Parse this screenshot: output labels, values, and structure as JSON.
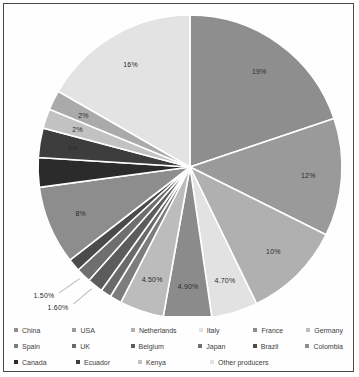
{
  "chart_data": {
    "type": "pie",
    "title": "",
    "start_angle_deg": 0,
    "direction": "clockwise",
    "legend_position": "bottom",
    "grid": false,
    "unit": "%",
    "categories": [
      "China",
      "USA",
      "Netherlands",
      "Italy",
      "France",
      "Germany",
      "Spain",
      "UK",
      "Belgium",
      "Japan",
      "Brazil",
      "Colombia",
      "Canada",
      "Ecuador",
      "Kenya",
      "Other producers"
    ],
    "values": [
      19,
      12,
      10,
      4.7,
      4.9,
      4.5,
      1.2,
      1.1,
      1.6,
      1.5,
      1.3,
      8,
      3,
      2,
      2,
      16
    ],
    "labels": [
      "19%",
      "12%",
      "10%",
      "4.70%",
      "4.90%",
      "4.50%",
      "",
      "",
      "1.60%",
      "1.50%",
      "",
      "8%",
      "3%",
      "2%",
      "2%",
      "16%"
    ],
    "colors": [
      "#8e8e8e",
      "#9a9a9a",
      "#b3b3b3",
      "#e4e4e4",
      "#a2a2a2",
      "#b8b8b8",
      "#8a8a8a",
      "#6e6e6e",
      "#5e5e5e",
      "#707070",
      "#4a4a4a",
      "#8c8c8c",
      "#2e2e2e",
      "#3f3f3f",
      "#c6c6c6",
      "#a8a8a8"
    ],
    "slices": [
      {
        "name": "China",
        "value": 19,
        "label": "19%",
        "color": "#8e8e8e"
      },
      {
        "name": "USA",
        "value": 12,
        "label": "12%",
        "color": "#9a9a9a"
      },
      {
        "name": "Netherlands",
        "value": 10,
        "label": "10%",
        "color": "#b0b0b0"
      },
      {
        "name": "Italy",
        "value": 4.7,
        "label": "4.70%",
        "color": "#e2e2e2"
      },
      {
        "name": "France",
        "value": 4.9,
        "label": "4.90%",
        "color": "#8b8b8b"
      },
      {
        "name": "Germany",
        "value": 4.5,
        "label": "4.50%",
        "color": "#bcbcbc"
      },
      {
        "name": "Spain",
        "value": 1.2,
        "label": "",
        "color": "#7d7d7d"
      },
      {
        "name": "UK",
        "value": 1.1,
        "label": "",
        "color": "#6a6a6a"
      },
      {
        "name": "Belgium",
        "value": 1.6,
        "label": "1.60%",
        "color": "#5c5c5c"
      },
      {
        "name": "Japan",
        "value": 1.5,
        "label": "1.50%",
        "color": "#6f6f6f"
      },
      {
        "name": "Brazil",
        "value": 1.3,
        "label": "",
        "color": "#4b4b4b"
      },
      {
        "name": "Colombia",
        "value": 8,
        "label": "8%",
        "color": "#8d8d8d"
      },
      {
        "name": "Canada",
        "value": 3,
        "label": "",
        "color": "#2b2b2b"
      },
      {
        "name": "Ecuador",
        "value": 3,
        "label": "3%",
        "color": "#3d3d3d"
      },
      {
        "name": "Kenya",
        "value": 2,
        "label": "2%",
        "color": "#c2c2c2"
      },
      {
        "name": "Other2",
        "value": 2,
        "label": "2%",
        "color": "#aaaaaa"
      },
      {
        "name": "Other producers",
        "value": 16,
        "label": "16%",
        "color": "#e3e3e3"
      }
    ]
  },
  "legend": {
    "rows": [
      [
        {
          "label": "China",
          "color": "#8e8e8e"
        },
        {
          "label": "USA",
          "color": "#9a9a9a"
        },
        {
          "label": "Netherlands",
          "color": "#b0b0b0"
        },
        {
          "label": "Italy",
          "color": "#e2e2e2"
        },
        {
          "label": "France",
          "color": "#8b8b8b"
        },
        {
          "label": "Germany",
          "color": "#bcbcbc"
        }
      ],
      [
        {
          "label": "Spain",
          "color": "#7d7d7d"
        },
        {
          "label": "UK",
          "color": "#6a6a6a"
        },
        {
          "label": "Belgium",
          "color": "#5c5c5c"
        },
        {
          "label": "Japan",
          "color": "#6f6f6f"
        },
        {
          "label": "Brazil",
          "color": "#4b4b4b"
        },
        {
          "label": "Colombia",
          "color": "#8d8d8d"
        }
      ],
      [
        {
          "label": "Canada",
          "color": "#2b2b2b"
        },
        {
          "label": "Ecuador",
          "color": "#3d3d3d"
        },
        {
          "label": "Kenya",
          "color": "#c2c2c2"
        },
        {
          "label": "Other producers",
          "color": "#e3e3e3"
        }
      ]
    ]
  }
}
